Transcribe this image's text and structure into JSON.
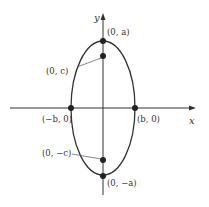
{
  "diagram": {
    "type": "ellipse-vertical-major-axis",
    "axes": {
      "x_label": "x",
      "y_label": "y"
    },
    "points": {
      "top_vertex": "(0, a)",
      "top_focus": "(0, c)",
      "left_vertex": "(−b, 0)",
      "right_vertex": "(b, 0)",
      "bottom_focus": "(0, −c)",
      "bottom_vertex": "(0, −a)"
    },
    "colors": {
      "stroke": "#333333",
      "background": "#ffffff"
    }
  }
}
